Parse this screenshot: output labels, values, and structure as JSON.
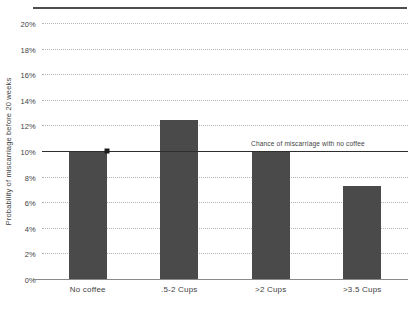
{
  "chart_data": {
    "type": "bar",
    "title": "",
    "subtitle": "",
    "xlabel": "",
    "ylabel": "Probability of miscarriage before 20 weeks",
    "categories": [
      "No coffee",
      ".5-2 Cups",
      ">2 Cups",
      ">3.5 Cups"
    ],
    "values": [
      10.0,
      12.4,
      10.0,
      7.3
    ],
    "series": [
      {
        "name": "Probability of miscarriage before 20 weeks",
        "values": [
          10.0,
          12.4,
          10.0,
          7.3
        ]
      }
    ],
    "ylim": [
      0,
      20
    ],
    "ytick_labels": [
      "0%",
      "2%",
      "4%",
      "6%",
      "8%",
      "10%",
      "12%",
      "14%",
      "16%",
      "18%",
      "20%"
    ],
    "ytick_values": [
      0,
      2,
      4,
      6,
      8,
      10,
      12,
      14,
      16,
      18,
      20
    ],
    "grid": true,
    "grid_style": "dotted",
    "legend": false,
    "legend_position": "none",
    "bar_color": "#4a4a4a",
    "grid_color": "#b4b4b4",
    "axis_color": "#8a8a8a",
    "text_color": "#3f3f3f",
    "annotations": [
      {
        "type": "reference-line",
        "label": "Chance of miscarriage with no coffee",
        "value": 10.0,
        "color": "#2e2e2e",
        "marker": "square",
        "marker_category": "No coffee"
      }
    ]
  }
}
